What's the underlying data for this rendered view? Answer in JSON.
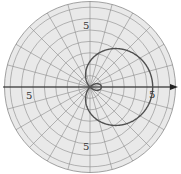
{
  "chart_data": {
    "type": "line",
    "subtype": "polar",
    "title": "",
    "equation_form": "r = a + b*cos(theta)",
    "params": {
      "a": 2.25,
      "b": 3.25
    },
    "theta_range_deg": [
      0,
      360
    ],
    "radial_max": 7.5,
    "ring_step": 1,
    "spoke_step_deg": 15,
    "axis": {
      "horizontal": true,
      "arrow": "right"
    },
    "tick_labels": [
      {
        "text": "5",
        "position": "top",
        "r": 5,
        "theta_deg": 90
      },
      {
        "text": "5",
        "position": "left",
        "r": 5,
        "theta_deg": 180
      },
      {
        "text": "5",
        "position": "right",
        "r": 5,
        "theta_deg": 0
      },
      {
        "text": "5",
        "position": "bottom",
        "r": 5,
        "theta_deg": 270
      }
    ],
    "grid": true,
    "legend": null
  },
  "colors": {
    "background": "#e9e9e9",
    "grid": "#8a8a8a",
    "axis": "#222222",
    "curve": "#505050"
  },
  "layout": {
    "cx": 90,
    "cy": 87,
    "px_per_unit": 11.4
  }
}
